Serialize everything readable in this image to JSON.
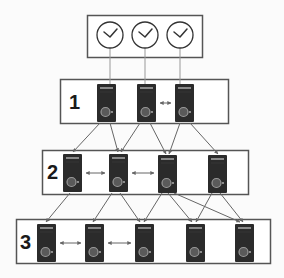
{
  "diagram": {
    "type": "tiered-time-sync-hierarchy",
    "colors": {
      "background": "#fbfbfb",
      "box_border": "#555555",
      "box_fill": "#ffffff",
      "server_body": "#2b2b2b",
      "server_stripe": "#8a8a8a",
      "server_button": "#9a9a9a",
      "link_line": "#666666",
      "clock_stroke": "#333333"
    },
    "reference_clocks": {
      "box": {
        "x": 87,
        "y": 15,
        "w": 115,
        "h": 42
      },
      "icon": "clock-icon",
      "clocks": [
        {
          "cx": 110,
          "cy": 35
        },
        {
          "cx": 145,
          "cy": 35
        },
        {
          "cx": 180,
          "cy": 35
        }
      ]
    },
    "tiers": [
      {
        "label": "1",
        "box": {
          "x": 60,
          "y": 79,
          "w": 168,
          "h": 44
        },
        "label_pos": {
          "x": 69,
          "y": 92
        },
        "servers": [
          {
            "x": 97,
            "y": 84
          },
          {
            "x": 137,
            "y": 84
          },
          {
            "x": 175,
            "y": 84
          }
        ],
        "peer_links": [
          [
            1,
            2
          ]
        ]
      },
      {
        "label": "2",
        "box": {
          "x": 42,
          "y": 150,
          "w": 206,
          "h": 44
        },
        "label_pos": {
          "x": 47,
          "y": 162
        },
        "servers": [
          {
            "x": 63,
            "y": 154
          },
          {
            "x": 109,
            "y": 154
          },
          {
            "x": 158,
            "y": 155
          },
          {
            "x": 208,
            "y": 155
          }
        ],
        "peer_links": [
          [
            0,
            1
          ],
          [
            1,
            2
          ]
        ]
      },
      {
        "label": "3",
        "box": {
          "x": 16,
          "y": 219,
          "w": 254,
          "h": 44
        },
        "label_pos": {
          "x": 20,
          "y": 232
        },
        "servers": [
          {
            "x": 37,
            "y": 224
          },
          {
            "x": 85,
            "y": 224
          },
          {
            "x": 135,
            "y": 224
          },
          {
            "x": 186,
            "y": 224
          },
          {
            "x": 235,
            "y": 224
          }
        ],
        "peer_links": [
          [
            0,
            1
          ],
          [
            1,
            2
          ]
        ]
      }
    ],
    "clock_links": [
      {
        "x": 110,
        "y1": 48,
        "y2": 84
      },
      {
        "x": 145,
        "y1": 48,
        "y2": 84
      },
      {
        "x": 180,
        "y1": 48,
        "y2": 84
      }
    ],
    "uplinks": [
      {
        "x1": 100,
        "y1": 123,
        "x2": 73,
        "y2": 152
      },
      {
        "x1": 110,
        "y1": 123,
        "x2": 118,
        "y2": 152
      },
      {
        "x1": 140,
        "y1": 123,
        "x2": 121,
        "y2": 152
      },
      {
        "x1": 150,
        "y1": 123,
        "x2": 166,
        "y2": 154
      },
      {
        "x1": 180,
        "y1": 123,
        "x2": 169,
        "y2": 154
      },
      {
        "x1": 190,
        "y1": 123,
        "x2": 218,
        "y2": 154
      },
      {
        "x1": 70,
        "y1": 193,
        "x2": 46,
        "y2": 222
      },
      {
        "x1": 112,
        "y1": 193,
        "x2": 93,
        "y2": 222
      },
      {
        "x1": 120,
        "y1": 193,
        "x2": 140,
        "y2": 222
      },
      {
        "x1": 162,
        "y1": 193,
        "x2": 144,
        "y2": 222
      },
      {
        "x1": 168,
        "y1": 193,
        "x2": 192,
        "y2": 222
      },
      {
        "x1": 174,
        "y1": 193,
        "x2": 240,
        "y2": 222
      },
      {
        "x1": 212,
        "y1": 193,
        "x2": 196,
        "y2": 222
      },
      {
        "x1": 220,
        "y1": 193,
        "x2": 243,
        "y2": 222
      }
    ]
  }
}
